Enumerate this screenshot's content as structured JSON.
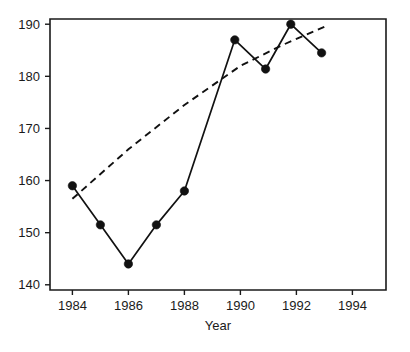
{
  "chart_data": {
    "type": "line",
    "title": "",
    "subtitle": "",
    "xlabel": "Year",
    "ylabel": "",
    "xlim": [
      1983.2,
      1995.2
    ],
    "ylim": [
      139.0,
      191.0
    ],
    "xticks": [
      1984,
      1986,
      1988,
      1990,
      1992,
      1994
    ],
    "xtick_labels": [
      "1984",
      "1986",
      "1988",
      "1990",
      "1992",
      "1994"
    ],
    "yticks": [
      140,
      150,
      160,
      170,
      180,
      190
    ],
    "ytick_labels": [
      "140",
      "150",
      "160",
      "170",
      "180",
      "190"
    ],
    "grid": false,
    "legend": false,
    "legend_position": "none",
    "frame": "box",
    "series": [
      {
        "name": "observed",
        "style": "solid-with-markers",
        "marker": "filled-circle",
        "color": "#111111",
        "x": [
          1984.0,
          1985.0,
          1986.0,
          1987.0,
          1988.0,
          1989.8,
          1990.9,
          1991.8,
          1992.9
        ],
        "values": [
          159.0,
          151.5,
          144.0,
          151.5,
          158.0,
          187.0,
          181.4,
          190.0,
          184.5
        ]
      },
      {
        "name": "trend",
        "style": "dashed",
        "marker": "none",
        "color": "#111111",
        "x": [
          1984.0,
          1986.0,
          1988.0,
          1990.0,
          1991.5,
          1993.0
        ],
        "values": [
          156.5,
          166.0,
          174.5,
          182.0,
          186.0,
          189.5
        ]
      }
    ],
    "annotations": []
  }
}
